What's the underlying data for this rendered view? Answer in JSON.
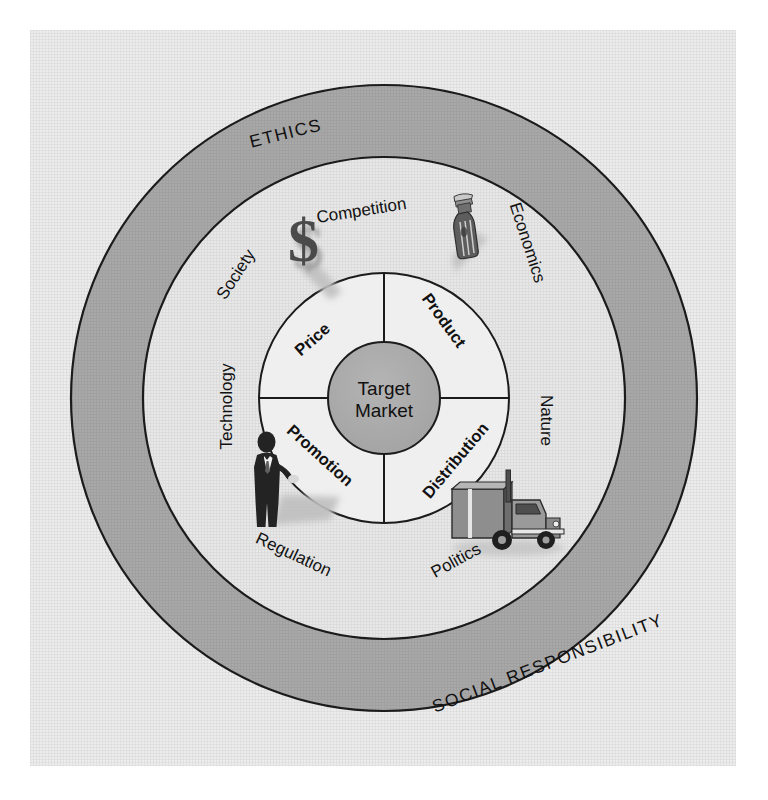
{
  "diagram": {
    "core": {
      "line1": "Target",
      "line2": "Market"
    },
    "marketing_mix": [
      {
        "id": "price",
        "label": "Price",
        "quadrant": "upper-left"
      },
      {
        "id": "product",
        "label": "Product",
        "quadrant": "upper-right"
      },
      {
        "id": "distribution",
        "label": "Distribution",
        "quadrant": "lower-right"
      },
      {
        "id": "promotion",
        "label": "Promotion",
        "quadrant": "lower-left"
      }
    ],
    "environment_forces": [
      {
        "id": "competition",
        "label": "Competition"
      },
      {
        "id": "economics",
        "label": "Economics"
      },
      {
        "id": "nature",
        "label": "Nature"
      },
      {
        "id": "politics",
        "label": "Politics"
      },
      {
        "id": "regulation",
        "label": "Regulation"
      },
      {
        "id": "technology",
        "label": "Technology"
      },
      {
        "id": "society",
        "label": "Society"
      }
    ],
    "outer_ring": [
      {
        "id": "ethics",
        "label": "ETHICS"
      },
      {
        "id": "social-responsibility",
        "label": "SOCIAL RESPONSIBILITY"
      }
    ],
    "icons": [
      {
        "id": "dollar-sign-icon",
        "glyph": "$",
        "near": "Competition"
      },
      {
        "id": "bottle-icon",
        "glyph": "",
        "near": "Economics"
      },
      {
        "id": "truck-icon",
        "glyph": "",
        "near": "Politics"
      },
      {
        "id": "businessman-icon",
        "glyph": "",
        "near": "Regulation"
      }
    ],
    "colors": {
      "page_background": "#ffffff",
      "panel_background": "#ececec",
      "outer_ring_fill": "#a8a8a8",
      "middle_ring_fill": "#e4e4e4",
      "mix_ring_fill": "#ededed",
      "core_fill": "#a8a8a8",
      "stroke": "#1b1b1b",
      "text": "#111111"
    }
  }
}
